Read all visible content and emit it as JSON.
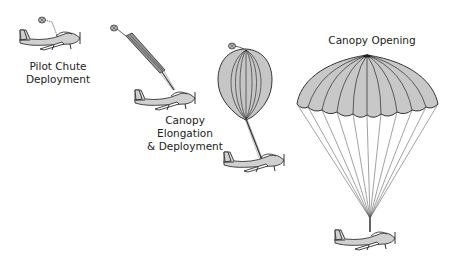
{
  "diagram": {
    "stages": [
      {
        "id": "pilot-chute",
        "label": "Pilot Chute\nDeployment"
      },
      {
        "id": "elongation",
        "label": "Canopy\nElongation\n& Deployment"
      },
      {
        "id": "inflation",
        "label": ""
      },
      {
        "id": "opening",
        "label": "Canopy Opening"
      }
    ]
  },
  "colors": {
    "canopy_fill": "#c8c8c8",
    "line": "#333333",
    "aircraft_fill": "#d0d0d0"
  }
}
